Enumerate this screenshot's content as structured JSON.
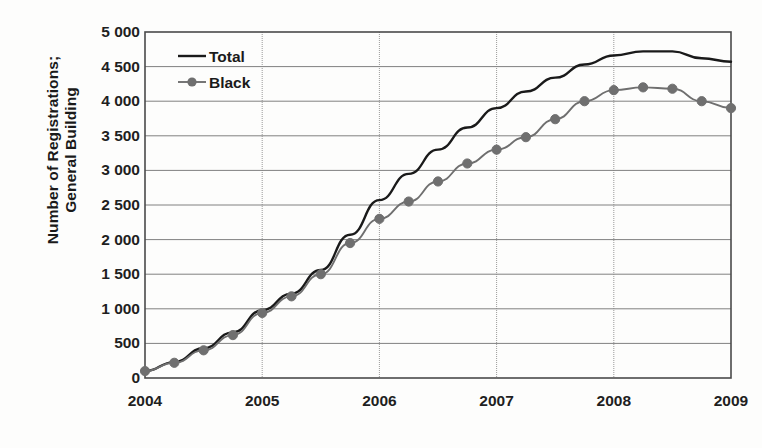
{
  "chart_data": {
    "type": "line",
    "title": "",
    "xlabel": "",
    "ylabel": "Number of Registrations; General Building",
    "ylabel_lines": [
      "Number of Registrations;",
      "General Building"
    ],
    "xlim": [
      2004,
      2009
    ],
    "ylim": [
      0,
      5000
    ],
    "ytick_step": 500,
    "grid": true,
    "legend_position": "top-left",
    "ytick_labels": [
      "5 000",
      "4 500",
      "4 000",
      "3 500",
      "3 000",
      "2 500",
      "2 000",
      "1 500",
      "1 000",
      "500",
      "0"
    ],
    "ytick_values": [
      5000,
      4500,
      4000,
      3500,
      3000,
      2500,
      2000,
      1500,
      1000,
      500,
      0
    ],
    "xtick_labels": [
      "2004",
      "2005",
      "2006",
      "2007",
      "2008",
      "2009"
    ],
    "xtick_values": [
      2004,
      2005,
      2006,
      2007,
      2008,
      2009
    ],
    "x": [
      2004.0,
      2004.25,
      2004.5,
      2004.75,
      2005.0,
      2005.25,
      2005.5,
      2005.75,
      2006.0,
      2006.25,
      2006.5,
      2006.75,
      2007.0,
      2007.25,
      2007.5,
      2007.75,
      2008.0,
      2008.25,
      2008.5,
      2008.75,
      2009.0
    ],
    "series": [
      {
        "name": "Total",
        "color": "#1a1a1a",
        "marker": "none",
        "values": [
          100,
          230,
          430,
          660,
          980,
          1220,
          1560,
          2070,
          2570,
          2950,
          3300,
          3620,
          3900,
          4140,
          4340,
          4530,
          4660,
          4720,
          4720,
          4620,
          4570
        ]
      },
      {
        "name": "Black",
        "color": "#6f6f6f",
        "marker": "circle",
        "values": [
          100,
          220,
          400,
          620,
          940,
          1180,
          1500,
          1950,
          2300,
          2550,
          2840,
          3100,
          3300,
          3480,
          3740,
          4000,
          4160,
          4200,
          4180,
          4000,
          3900
        ]
      }
    ],
    "legend_entries": [
      {
        "label": "Total",
        "color": "#1a1a1a",
        "marker": "none"
      },
      {
        "label": "Black",
        "color": "#6f6f6f",
        "marker": "circle"
      }
    ]
  },
  "colors": {
    "plot_border": "#4a4a4a",
    "gridline": "#808080",
    "background": "#fdfdfc",
    "text": "#1a1a1a"
  }
}
